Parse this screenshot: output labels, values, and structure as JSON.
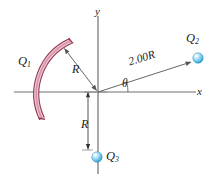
{
  "figure": {
    "type": "physics-diagram",
    "background_color": "#ffffff"
  },
  "axes": {
    "x_label": "x",
    "y_label": "y",
    "origin": {
      "x": 98,
      "y": 92
    },
    "x_axis": {
      "x1": 14,
      "y1": 92,
      "x2": 196,
      "y2": 92
    },
    "y_axis": {
      "x1": 98,
      "y1": 16,
      "x2": 98,
      "y2": 174
    },
    "color": "#6b6b6b"
  },
  "charges": [
    {
      "name": "Q1",
      "label": "Q",
      "subscript": "1",
      "shape": "arc",
      "outline_color": "#8c2b46",
      "fill_color": "#e8a8bc",
      "radius": 58,
      "start_angle_deg": 118,
      "end_angle_deg": 208
    },
    {
      "name": "Q2",
      "label": "Q",
      "subscript": "2",
      "shape": "sphere",
      "color": "#6fc6ee",
      "highlight_color": "#ffffff",
      "cx": 198,
      "cy": 58,
      "r": 5
    },
    {
      "name": "Q3",
      "label": "Q",
      "subscript": "3",
      "shape": "sphere",
      "color": "#6fc6ee",
      "highlight_color": "#ffffff",
      "cx": 97,
      "cy": 157,
      "r": 5
    }
  ],
  "dimensions": [
    {
      "name": "radius-to-arc",
      "label": "R",
      "from": {
        "x": 98,
        "y": 92
      },
      "to": {
        "x": 62,
        "y": 47
      }
    },
    {
      "name": "origin-to-q3",
      "label": "R",
      "from": {
        "x": 97,
        "y": 92
      },
      "to": {
        "x": 97,
        "y": 151
      }
    },
    {
      "name": "origin-to-q2",
      "label": "2.00R",
      "from": {
        "x": 98,
        "y": 92
      },
      "to": {
        "x": 192,
        "y": 62
      }
    }
  ],
  "angle": {
    "label": "θ",
    "vertex": {
      "x": 98,
      "y": 92
    },
    "between": [
      "x-axis",
      "2.00R line"
    ]
  }
}
